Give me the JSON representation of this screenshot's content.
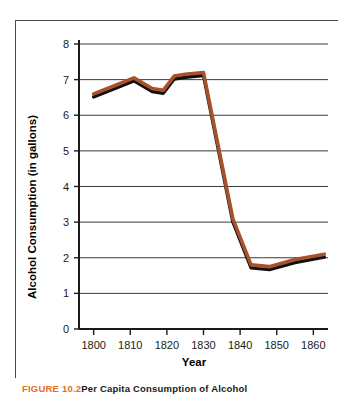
{
  "figure": {
    "caption_label": "FIGURE 10.2",
    "caption_text": "Per Capita Consumption of Alcohol"
  },
  "colors": {
    "line": "#A8512A",
    "line_shadow": "#111111",
    "gridline": "#3a3a3a",
    "axis": "#1a1a1a",
    "frame": "#4a4a4a",
    "caption_label": "#E2701E",
    "background": "#ffffff"
  },
  "chart_data": {
    "type": "line",
    "title": "",
    "xlabel": "Year",
    "ylabel": "Alcohol Consumption (in gallons)",
    "xlim": [
      1796,
      1864
    ],
    "ylim": [
      0,
      8
    ],
    "xticks": [
      1800,
      1810,
      1820,
      1830,
      1840,
      1850,
      1860
    ],
    "xtick_labels": [
      "1800",
      "1810",
      "1820",
      "1830",
      "1840",
      "1850",
      "1860"
    ],
    "yticks": [
      0,
      1,
      2,
      3,
      4,
      5,
      6,
      7,
      8
    ],
    "ytick_labels": [
      "0",
      "1",
      "2",
      "3",
      "4",
      "5",
      "6",
      "7",
      "8"
    ],
    "grid": true,
    "grid_axis": "y",
    "legend": false,
    "series": [
      {
        "name": "Per capita alcohol consumption",
        "x": [
          1800,
          1805,
          1811,
          1816,
          1819,
          1822,
          1825,
          1830,
          1838,
          1843,
          1848,
          1855,
          1863
        ],
        "values": [
          6.6,
          6.8,
          7.05,
          6.75,
          6.7,
          7.1,
          7.15,
          7.2,
          3.1,
          1.8,
          1.75,
          1.95,
          2.1
        ]
      }
    ]
  }
}
